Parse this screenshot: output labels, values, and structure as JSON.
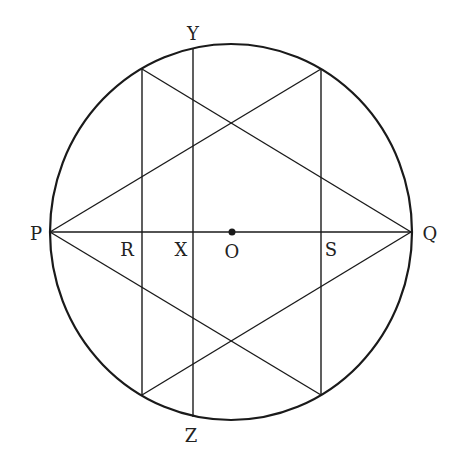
{
  "diagram": {
    "stroke_color": "#1a1a1a",
    "background": "#ffffff",
    "circle": {
      "cx": 231,
      "cy": 232,
      "rx": 181,
      "ry": 188,
      "stroke_width": 2.2
    },
    "center_point": {
      "label": "O",
      "x": 232,
      "y": 232,
      "label_x": 232,
      "label_y": 258
    },
    "points": {
      "P": {
        "label": "P",
        "x": 50,
        "y": 232,
        "label_x": 36,
        "label_y": 240
      },
      "Q": {
        "label": "Q",
        "x": 411,
        "y": 232,
        "label_x": 430,
        "label_y": 240
      },
      "R": {
        "label": "R",
        "x": 142,
        "y": 232,
        "label_x": 127,
        "label_y": 256
      },
      "X": {
        "label": "X",
        "x": 193,
        "y": 232,
        "label_x": 181,
        "label_y": 256
      },
      "S": {
        "label": "S",
        "x": 321,
        "y": 232,
        "label_x": 331,
        "label_y": 256
      },
      "Y": {
        "label": "Y",
        "x": 193,
        "y": 48,
        "label_x": 193,
        "label_y": 40
      },
      "Z": {
        "label": "Z",
        "x": 193,
        "y": 417,
        "label_x": 191,
        "label_y": 442
      }
    },
    "segments": [
      {
        "name": "diameter-PQ",
        "x1": 50,
        "y1": 232,
        "x2": 411,
        "y2": 232
      },
      {
        "name": "chord-R-vertical",
        "x1": 142,
        "y1": 69,
        "x2": 142,
        "y2": 395
      },
      {
        "name": "chord-S-vertical",
        "x1": 321,
        "y1": 69,
        "x2": 321,
        "y2": 395
      },
      {
        "name": "chord-YZ",
        "x1": 193,
        "y1": 48,
        "x2": 193,
        "y2": 417
      },
      {
        "name": "line-P-to-top-right",
        "x1": 50,
        "y1": 232,
        "x2": 321,
        "y2": 69
      },
      {
        "name": "line-P-to-bottom-right",
        "x1": 50,
        "y1": 232,
        "x2": 321,
        "y2": 395
      },
      {
        "name": "line-Q-to-top-left",
        "x1": 411,
        "y1": 232,
        "x2": 142,
        "y2": 69
      },
      {
        "name": "line-Q-to-bottom-left",
        "x1": 411,
        "y1": 232,
        "x2": 142,
        "y2": 395
      }
    ]
  }
}
